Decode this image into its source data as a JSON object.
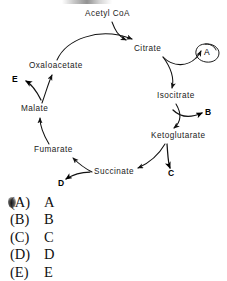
{
  "diagram": {
    "entry": {
      "label": "Acetyl CoA"
    },
    "nodes": [
      {
        "id": "citrate",
        "label": "Citrate"
      },
      {
        "id": "isocitrate",
        "label": "Isocitrate"
      },
      {
        "id": "ketoglutarate",
        "label": "Ketoglutarate"
      },
      {
        "id": "succinate",
        "label": "Succinate"
      },
      {
        "id": "fumarate",
        "label": "Fumarate"
      },
      {
        "id": "malate",
        "label": "Malate"
      },
      {
        "id": "oxaloacetate",
        "label": "Oxaloacetate"
      }
    ],
    "branch_labels": [
      {
        "id": "a",
        "label": "A",
        "circled": "yes"
      },
      {
        "id": "b",
        "label": "B",
        "circled": "no"
      },
      {
        "id": "c",
        "label": "C",
        "circled": "no"
      },
      {
        "id": "d",
        "label": "D",
        "circled": "no"
      },
      {
        "id": "e",
        "label": "E",
        "circled": "no"
      }
    ]
  },
  "choices": [
    {
      "paren": "(A)",
      "text": "A",
      "marked": true
    },
    {
      "paren": "(B)",
      "text": "B",
      "marked": false
    },
    {
      "paren": "(C)",
      "text": "C",
      "marked": false
    },
    {
      "paren": "(D)",
      "text": "D",
      "marked": false
    },
    {
      "paren": "(E)",
      "text": "E",
      "marked": false
    }
  ]
}
